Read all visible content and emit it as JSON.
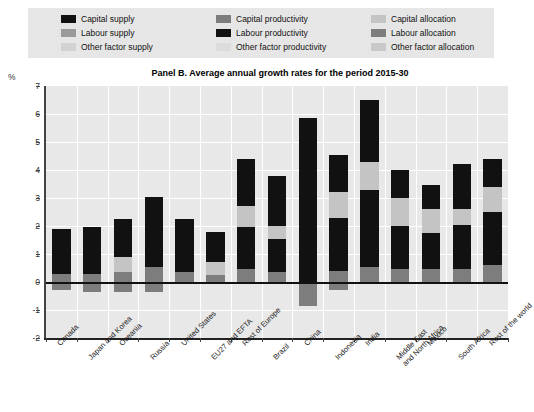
{
  "chart_data": {
    "type": "bar",
    "subtype": "stacked-bar",
    "title": "Panel B. Average annual growth rates for the period 2015-30",
    "xlabel": "",
    "ylabel": "%",
    "ylim": [
      -2,
      7
    ],
    "yticks": [
      7,
      6,
      5,
      4,
      3,
      2,
      1,
      0,
      -1,
      -2
    ],
    "grid": true,
    "legend_position": "top",
    "categories": [
      "Canada",
      "Japan and Korea",
      "Oceania",
      "Russia",
      "United States",
      "EU27 and EFTA",
      "Rest of Europe",
      "Brazil",
      "China",
      "Indonesia",
      "India",
      "Middle East\nand North Africa",
      "Mexico",
      "South Africa",
      "Rest of the world"
    ],
    "totals": [
      1.9,
      1.95,
      2.25,
      3.05,
      2.25,
      1.8,
      4.4,
      3.8,
      5.85,
      4.55,
      6.5,
      4.0,
      3.45,
      4.2,
      4.4
    ],
    "series": [
      {
        "name": "Capital supply",
        "color": "#111111",
        "values": [
          0.55,
          0.85,
          0.75,
          1.2,
          0.85,
          0.6,
          1.7,
          1.8,
          5.85,
          1.35,
          2.2,
          1.0,
          0.85,
          1.6,
          1.0
        ]
      },
      {
        "name": "Labour supply",
        "color": "#7d7d7d",
        "values": [
          0.3,
          0.3,
          0.35,
          0.55,
          0.35,
          0.25,
          0.45,
          0.35,
          0.0,
          0.4,
          0.55,
          0.45,
          0.45,
          0.45,
          0.6
        ]
      },
      {
        "name": "Other factor supply",
        "color": "#c4c4c4",
        "values": [
          0.0,
          0.0,
          0.55,
          0.0,
          0.0,
          0.45,
          0.75,
          0.45,
          0.0,
          0.9,
          1.0,
          1.0,
          0.85,
          0.55,
          0.9
        ]
      },
      {
        "name": "Capital productivity",
        "color": "#7d7d7d",
        "values": [
          0.0,
          0.0,
          0.0,
          0.0,
          0.0,
          0.0,
          0.0,
          0.0,
          0.0,
          0.0,
          0.0,
          0.0,
          0.0,
          0.0,
          0.0
        ]
      },
      {
        "name": "Labour productivity",
        "color": "#111111",
        "values": [
          1.05,
          0.8,
          0.6,
          1.3,
          1.05,
          0.5,
          1.5,
          1.2,
          0.0,
          1.9,
          2.75,
          1.55,
          1.3,
          1.6,
          1.9
        ]
      },
      {
        "name": "Other factor productivity",
        "color": "#d6d6d6",
        "values": [
          0.0,
          0.0,
          0.0,
          0.0,
          0.0,
          0.0,
          0.0,
          0.0,
          0.0,
          0.0,
          0.0,
          0.0,
          0.0,
          0.0,
          0.0
        ]
      },
      {
        "name": "Capital allocation",
        "color": "#c4c4c4",
        "values": [
          0.0,
          0.0,
          0.0,
          0.0,
          0.0,
          0.0,
          0.0,
          0.0,
          0.0,
          0.0,
          0.0,
          0.0,
          0.0,
          0.0,
          0.0
        ]
      },
      {
        "name": "Labour allocation",
        "color": "#7d7d7d",
        "values": [
          -0.3,
          -0.35,
          -0.35,
          -0.35,
          0.0,
          0.0,
          0.0,
          0.0,
          -0.85,
          -0.3,
          0.0,
          0.0,
          0.0,
          0.0,
          0.0
        ]
      },
      {
        "name": "Other factor allocation",
        "color": "#d6d6d6",
        "values": [
          0.0,
          0.0,
          0.0,
          0.0,
          0.0,
          0.0,
          0.0,
          0.0,
          0.0,
          0.0,
          0.0,
          0.0,
          0.0,
          0.0,
          0.0
        ]
      }
    ],
    "bars": [
      {
        "category": "Canada",
        "positive": [
          {
            "s": "Labour supply",
            "v": 0.3
          },
          {
            "s": "Labour productivity",
            "v": 1.05
          },
          {
            "s": "Capital supply",
            "v": 0.55
          }
        ],
        "negative": [
          {
            "s": "Labour allocation",
            "v": -0.3
          }
        ]
      },
      {
        "category": "Japan and Korea",
        "positive": [
          {
            "s": "Labour supply",
            "v": 0.3
          },
          {
            "s": "Labour productivity",
            "v": 0.8
          },
          {
            "s": "Capital supply",
            "v": 0.85
          }
        ],
        "negative": [
          {
            "s": "Labour allocation",
            "v": -0.35
          }
        ]
      },
      {
        "category": "Oceania",
        "positive": [
          {
            "s": "Labour supply",
            "v": 0.35
          },
          {
            "s": "Other factor supply",
            "v": 0.55
          },
          {
            "s": "Labour productivity",
            "v": 0.6
          },
          {
            "s": "Capital supply",
            "v": 0.75
          }
        ],
        "negative": [
          {
            "s": "Labour allocation",
            "v": -0.35
          }
        ]
      },
      {
        "category": "Russia",
        "positive": [
          {
            "s": "Labour supply",
            "v": 0.55
          },
          {
            "s": "Labour productivity",
            "v": 1.3
          },
          {
            "s": "Capital supply",
            "v": 1.2
          }
        ],
        "negative": [
          {
            "s": "Labour allocation",
            "v": -0.35
          }
        ]
      },
      {
        "category": "United States",
        "positive": [
          {
            "s": "Labour supply",
            "v": 0.35
          },
          {
            "s": "Labour productivity",
            "v": 1.05
          },
          {
            "s": "Capital supply",
            "v": 0.85
          }
        ],
        "negative": []
      },
      {
        "category": "EU27 and EFTA",
        "positive": [
          {
            "s": "Labour supply",
            "v": 0.25
          },
          {
            "s": "Other factor supply",
            "v": 0.45
          },
          {
            "s": "Labour productivity",
            "v": 0.5
          },
          {
            "s": "Capital supply",
            "v": 0.6
          }
        ],
        "negative": []
      },
      {
        "category": "Rest of Europe",
        "positive": [
          {
            "s": "Labour supply",
            "v": 0.45
          },
          {
            "s": "Labour productivity",
            "v": 1.5
          },
          {
            "s": "Other factor supply",
            "v": 0.75
          },
          {
            "s": "Capital supply",
            "v": 1.7
          }
        ],
        "negative": []
      },
      {
        "category": "Brazil",
        "positive": [
          {
            "s": "Labour supply",
            "v": 0.35
          },
          {
            "s": "Labour productivity",
            "v": 1.2
          },
          {
            "s": "Other factor supply",
            "v": 0.45
          },
          {
            "s": "Capital supply",
            "v": 1.8
          }
        ],
        "negative": []
      },
      {
        "category": "China",
        "positive": [
          {
            "s": "Capital supply",
            "v": 5.85
          }
        ],
        "negative": [
          {
            "s": "Labour allocation",
            "v": -0.85
          }
        ]
      },
      {
        "category": "Indonesia",
        "positive": [
          {
            "s": "Labour supply",
            "v": 0.4
          },
          {
            "s": "Labour productivity",
            "v": 1.9
          },
          {
            "s": "Other factor supply",
            "v": 0.9
          },
          {
            "s": "Capital supply",
            "v": 1.35
          }
        ],
        "negative": [
          {
            "s": "Labour allocation",
            "v": -0.3
          }
        ]
      },
      {
        "category": "India",
        "positive": [
          {
            "s": "Labour supply",
            "v": 0.55
          },
          {
            "s": "Labour productivity",
            "v": 2.75
          },
          {
            "s": "Other factor supply",
            "v": 1.0
          },
          {
            "s": "Capital supply",
            "v": 2.2
          }
        ],
        "negative": []
      },
      {
        "category": "Middle East and North Africa",
        "positive": [
          {
            "s": "Labour supply",
            "v": 0.45
          },
          {
            "s": "Labour productivity",
            "v": 1.55
          },
          {
            "s": "Other factor supply",
            "v": 1.0
          },
          {
            "s": "Capital supply",
            "v": 1.0
          }
        ],
        "negative": []
      },
      {
        "category": "Mexico",
        "positive": [
          {
            "s": "Labour supply",
            "v": 0.45
          },
          {
            "s": "Labour productivity",
            "v": 1.3
          },
          {
            "s": "Other factor supply",
            "v": 0.85
          },
          {
            "s": "Capital supply",
            "v": 0.85
          }
        ],
        "negative": []
      },
      {
        "category": "South Africa",
        "positive": [
          {
            "s": "Labour supply",
            "v": 0.45
          },
          {
            "s": "Labour productivity",
            "v": 1.6
          },
          {
            "s": "Other factor supply",
            "v": 0.55
          },
          {
            "s": "Capital supply",
            "v": 1.6
          }
        ],
        "negative": []
      },
      {
        "category": "Rest of the world",
        "positive": [
          {
            "s": "Labour supply",
            "v": 0.6
          },
          {
            "s": "Labour productivity",
            "v": 1.9
          },
          {
            "s": "Other factor supply",
            "v": 0.9
          },
          {
            "s": "Capital supply",
            "v": 1.0
          }
        ],
        "negative": []
      }
    ]
  },
  "legend": {
    "items": [
      {
        "label": "Capital supply",
        "color": "#111111"
      },
      {
        "label": "Capital productivity",
        "color": "#7d7d7d"
      },
      {
        "label": "Capital allocation",
        "color": "#c4c4c4"
      },
      {
        "label": "Labour supply",
        "color": "#9a9a9a"
      },
      {
        "label": "Labour productivity",
        "color": "#111111"
      },
      {
        "label": "Labour allocation",
        "color": "#7d7d7d"
      },
      {
        "label": "Other factor supply",
        "color": "#d2d2d2"
      },
      {
        "label": "Other factor productivity",
        "color": "#dcdcdc"
      },
      {
        "label": "Other factor allocation",
        "color": "#c9c9c9"
      }
    ]
  },
  "axis": {
    "unit_label": "%",
    "ytick_labels": [
      "7",
      "6",
      "5",
      "4",
      "3",
      "2",
      "1",
      "0",
      "-1",
      "-2"
    ]
  }
}
